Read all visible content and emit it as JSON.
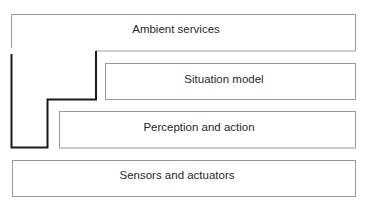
{
  "diagram": {
    "layers": [
      {
        "id": "ambient-services",
        "label": "Ambient services"
      },
      {
        "id": "situation-model",
        "label": "Situation model"
      },
      {
        "id": "perception-action",
        "label": "Perception and action"
      },
      {
        "id": "sensors-actuators",
        "label": "Sensors and actuators"
      }
    ],
    "colors": {
      "box_border": "#9a9a9a",
      "step_outline": "#1a1a1a",
      "text": "#2a2a2a",
      "background": "#ffffff"
    }
  }
}
